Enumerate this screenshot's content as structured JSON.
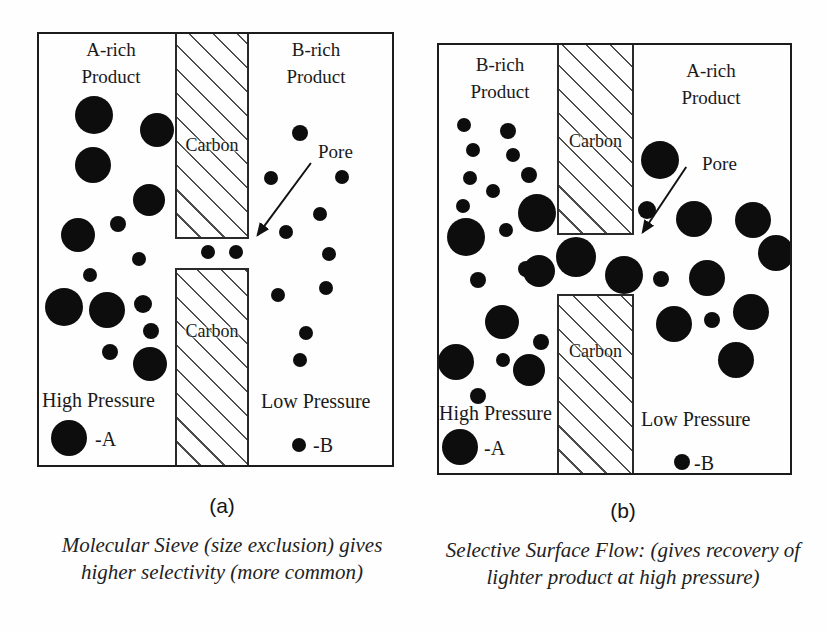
{
  "figure": {
    "colors": {
      "ink": "#111111",
      "paper": "#fefefe",
      "hatch_line": "#4d4d4d"
    },
    "panels": [
      {
        "tag": "(a)",
        "left_region_label": [
          "A-rich",
          "Product"
        ],
        "right_region_label": [
          "B-rich",
          "Product"
        ],
        "carbon_top_label": "Carbon",
        "carbon_bottom_label": "Carbon",
        "pore_label": "Pore",
        "left_pressure_label": "High Pressure",
        "right_pressure_label": "Low Pressure",
        "legend_a_label": "-A",
        "legend_b_label": "-B",
        "caption": [
          "Molecular Sieve (size exclusion)",
          "gives higher selectivity",
          "(more common)"
        ],
        "molecules_large": [
          [
            55,
            81,
            19
          ],
          [
            118,
            96,
            17
          ],
          [
            54,
            131,
            18
          ],
          [
            110,
            166,
            16
          ],
          [
            39,
            201,
            17
          ],
          [
            25,
            273,
            19
          ],
          [
            68,
            276,
            18
          ],
          [
            111,
            330,
            17
          ]
        ],
        "molecules_small": [
          [
            79,
            190,
            8
          ],
          [
            100,
            225,
            7
          ],
          [
            51,
            241,
            7
          ],
          [
            104,
            270,
            9
          ],
          [
            112,
            297,
            8
          ],
          [
            71,
            318,
            8
          ],
          [
            169,
            218,
            7
          ],
          [
            197,
            218,
            7
          ],
          [
            261,
            99,
            8
          ],
          [
            232,
            144,
            7
          ],
          [
            303,
            143,
            7
          ],
          [
            281,
            180,
            7
          ],
          [
            247,
            198,
            7
          ],
          [
            290,
            220,
            7
          ],
          [
            287,
            254,
            7
          ],
          [
            239,
            261,
            7
          ],
          [
            267,
            299,
            7
          ],
          [
            261,
            326,
            7
          ]
        ]
      },
      {
        "tag": "(b)",
        "left_region_label": [
          "B-rich",
          "Product"
        ],
        "right_region_label": [
          "A-rich",
          "Product"
        ],
        "carbon_top_label": "Carbon",
        "carbon_bottom_label": "Carbon",
        "pore_label": "Pore",
        "left_pressure_label": "High Pressure",
        "right_pressure_label": "Low Pressure",
        "legend_a_label": "-A",
        "legend_b_label": "-B",
        "caption": [
          "Selective Surface Flow:",
          "(gives recovery of lighter product at",
          "high pressure)"
        ],
        "molecules_large": [
          [
            98,
            168,
            19
          ],
          [
            27,
            192,
            19
          ],
          [
            63,
            277,
            17
          ],
          [
            17,
            317,
            18
          ],
          [
            90,
            325,
            16
          ],
          [
            137,
            212,
            20
          ],
          [
            100,
            226,
            16
          ],
          [
            185,
            230,
            19
          ],
          [
            221,
            115,
            19
          ],
          [
            255,
            174,
            18
          ],
          [
            314,
            175,
            18
          ],
          [
            337,
            208,
            18
          ],
          [
            268,
            233,
            18
          ],
          [
            235,
            279,
            18
          ],
          [
            312,
            267,
            18
          ],
          [
            297,
            315,
            18
          ]
        ],
        "molecules_small": [
          [
            25,
            80,
            7
          ],
          [
            69,
            86,
            8
          ],
          [
            34,
            105,
            7
          ],
          [
            74,
            110,
            7
          ],
          [
            90,
            130,
            8
          ],
          [
            31,
            133,
            7
          ],
          [
            54,
            146,
            7
          ],
          [
            24,
            161,
            7
          ],
          [
            67,
            185,
            7
          ],
          [
            87,
            224,
            8
          ],
          [
            39,
            235,
            8
          ],
          [
            102,
            297,
            8
          ],
          [
            64,
            315,
            7
          ],
          [
            39,
            351,
            8
          ],
          [
            208,
            165,
            9
          ],
          [
            222,
            234,
            8
          ],
          [
            273,
            275,
            8
          ]
        ]
      }
    ]
  }
}
